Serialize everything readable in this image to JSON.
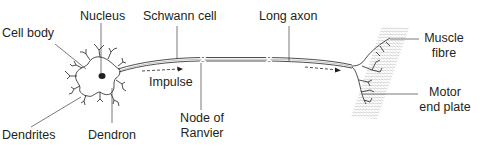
{
  "diagram": {
    "type": "labelled-diagram",
    "labels": {
      "cell_body": "Cell body",
      "nucleus": "Nucleus",
      "schwann_cell": "Schwann cell",
      "long_axon": "Long axon",
      "muscle_fibre_1": "Muscle",
      "muscle_fibre_2": "fibre",
      "impulse": "Impulse",
      "dendrites": "Dendrites",
      "dendron": "Dendron",
      "node_1": "Node of",
      "node_2": "Ranvier",
      "motor_1": "Motor",
      "motor_2": "end plate"
    },
    "colors": {
      "line": "#231f20",
      "muscle": "#c8c8c8"
    }
  }
}
